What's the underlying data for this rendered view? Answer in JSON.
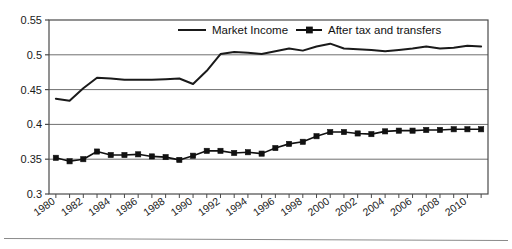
{
  "chart_data": {
    "type": "line",
    "title": "",
    "subtitle": "",
    "xlabel": "",
    "ylabel": "",
    "xlim": [
      1979.5,
      2011.5
    ],
    "ylim": [
      0.3,
      0.55
    ],
    "yticks": [
      "0.3",
      "0.35",
      "0.4",
      "0.45",
      "0.5",
      "0.55"
    ],
    "ytick_values": [
      0.3,
      0.35,
      0.4,
      0.45,
      0.5,
      0.55
    ],
    "grid": "horizontal",
    "legend_position": "top-center-inside",
    "x": [
      1980,
      1981,
      1982,
      1983,
      1984,
      1985,
      1986,
      1987,
      1988,
      1989,
      1990,
      1991,
      1992,
      1993,
      1994,
      1995,
      1996,
      1997,
      1998,
      1999,
      2000,
      2001,
      2002,
      2003,
      2004,
      2005,
      2006,
      2007,
      2008,
      2009,
      2010,
      2011
    ],
    "xtick_labels": [
      "1980",
      "1982",
      "1984",
      "1986",
      "1988",
      "1990",
      "1992",
      "1994",
      "1996",
      "1998",
      "2000",
      "2002",
      "2004",
      "2006",
      "2008",
      "2010"
    ],
    "xtick_label_values": [
      1980,
      1982,
      1984,
      1986,
      1988,
      1990,
      1992,
      1994,
      1996,
      1998,
      2000,
      2002,
      2004,
      2006,
      2008,
      2010
    ],
    "series": [
      {
        "name": "Market Income",
        "marker": "none",
        "color": "#1a1a1a",
        "values": [
          0.437,
          0.434,
          0.452,
          0.467,
          0.466,
          0.464,
          0.464,
          0.464,
          0.465,
          0.466,
          0.458,
          0.477,
          0.501,
          0.504,
          0.503,
          0.501,
          0.505,
          0.509,
          0.506,
          0.512,
          0.516,
          0.509,
          0.508,
          0.507,
          0.505,
          0.507,
          0.509,
          0.512,
          0.509,
          0.51,
          0.513,
          0.512
        ]
      },
      {
        "name": "After tax and transfers",
        "marker": "square",
        "color": "#111111",
        "values": [
          0.352,
          0.347,
          0.35,
          0.361,
          0.356,
          0.356,
          0.357,
          0.354,
          0.353,
          0.349,
          0.355,
          0.362,
          0.362,
          0.359,
          0.36,
          0.358,
          0.366,
          0.372,
          0.375,
          0.383,
          0.389,
          0.389,
          0.387,
          0.386,
          0.39,
          0.391,
          0.391,
          0.392,
          0.392,
          0.393,
          0.393,
          0.393
        ]
      }
    ]
  },
  "legend": {
    "entries": [
      {
        "label": "Market Income"
      },
      {
        "label": "After tax and transfers"
      }
    ]
  },
  "footer": {
    "rule": ""
  }
}
